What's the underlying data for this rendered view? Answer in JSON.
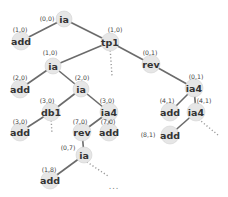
{
  "diagram": {
    "type": "tree",
    "nodes": [
      {
        "id": "n0",
        "label": "ia",
        "coord": "(0,0)",
        "x": 64,
        "y": 19,
        "cx": 47,
        "cy": 18
      },
      {
        "id": "n1",
        "label": "add",
        "coord": "(1,0)",
        "x": 21,
        "y": 41,
        "cx": 20,
        "cy": 29
      },
      {
        "id": "n2",
        "label": "tp1",
        "coord": "(1,0)",
        "x": 110,
        "y": 42,
        "cx": 115,
        "cy": 29
      },
      {
        "id": "n3",
        "label": "ia",
        "coord": "(1,0)",
        "x": 53,
        "y": 66,
        "cx": 50,
        "cy": 52
      },
      {
        "id": "n4",
        "label": "rev",
        "coord": "(0,1)",
        "x": 151,
        "y": 64,
        "cx": 150,
        "cy": 52
      },
      {
        "id": "n5",
        "label": "add",
        "coord": "(2,0)",
        "x": 20,
        "y": 89,
        "cx": 20,
        "cy": 77
      },
      {
        "id": "n6",
        "label": "ia",
        "coord": "(2,0)",
        "x": 81,
        "y": 89,
        "cx": 82,
        "cy": 77
      },
      {
        "id": "n7",
        "label": "ia4",
        "coord": "(0,1)",
        "x": 194,
        "y": 88,
        "cx": 196,
        "cy": 76
      },
      {
        "id": "n8",
        "label": "db1",
        "coord": "(3,0)",
        "x": 51,
        "y": 112,
        "cx": 47,
        "cy": 100
      },
      {
        "id": "n9",
        "label": "ia4",
        "coord": "(3,0)",
        "x": 109,
        "y": 112,
        "cx": 107,
        "cy": 100
      },
      {
        "id": "n10",
        "label": "add",
        "coord": "(4,1)",
        "x": 170,
        "y": 112,
        "cx": 167,
        "cy": 100
      },
      {
        "id": "n11",
        "label": "ia4",
        "coord": "(4,1)",
        "x": 196,
        "y": 112,
        "cx": 204,
        "cy": 100
      },
      {
        "id": "n12",
        "label": "add",
        "coord": "(3,0)",
        "x": 20,
        "y": 132,
        "cx": 20,
        "cy": 121
      },
      {
        "id": "n13",
        "label": "rev",
        "coord": "(7,0)",
        "x": 82,
        "y": 132,
        "cx": 80,
        "cy": 121
      },
      {
        "id": "n14",
        "label": "add",
        "coord": "(7,0)",
        "x": 109,
        "y": 132,
        "cx": 108,
        "cy": 121
      },
      {
        "id": "n15",
        "label": "add",
        "coord": "(8,1)",
        "x": 170,
        "y": 135,
        "cx": 148,
        "cy": 134
      },
      {
        "id": "n16",
        "label": "ia",
        "coord": "(0,7)",
        "x": 84,
        "y": 155,
        "cx": 68,
        "cy": 147
      },
      {
        "id": "n17",
        "label": "add",
        "coord": "(1,8)",
        "x": 50,
        "y": 180,
        "cx": 49,
        "cy": 169
      }
    ],
    "edges": [
      {
        "from": "n0",
        "to": "n1",
        "style": "solid"
      },
      {
        "from": "n0",
        "to": "n2",
        "style": "solid"
      },
      {
        "from": "n2",
        "to": "n3",
        "style": "solid"
      },
      {
        "from": "n2",
        "to": "n4",
        "style": "solid"
      },
      {
        "from": "n3",
        "to": "n5",
        "style": "solid"
      },
      {
        "from": "n3",
        "to": "n6",
        "style": "solid"
      },
      {
        "from": "n4",
        "to": "n7",
        "style": "solid"
      },
      {
        "from": "n6",
        "to": "n8",
        "style": "solid"
      },
      {
        "from": "n6",
        "to": "n9",
        "style": "solid"
      },
      {
        "from": "n7",
        "to": "n10",
        "style": "solid"
      },
      {
        "from": "n7",
        "to": "n11",
        "style": "solid"
      },
      {
        "from": "n8",
        "to": "n12",
        "style": "solid"
      },
      {
        "from": "n9",
        "to": "n13",
        "style": "solid"
      },
      {
        "from": "n9",
        "to": "n14",
        "style": "solid"
      },
      {
        "from": "n11",
        "to": "n15",
        "style": "solid"
      },
      {
        "from": "n13",
        "to": "n16",
        "style": "solid"
      },
      {
        "from": "n16",
        "to": "n17",
        "style": "solid"
      }
    ],
    "dotted_branches": [
      {
        "from": "n2",
        "x2": 112,
        "y2": 76
      },
      {
        "from": "n8",
        "x2": 52,
        "y2": 134
      },
      {
        "from": "n11",
        "x2": 218,
        "y2": 135
      },
      {
        "from": "n16",
        "x2": 108,
        "y2": 176
      }
    ],
    "ellipsis": {
      "text": "...",
      "x": 114,
      "y": 189
    }
  }
}
